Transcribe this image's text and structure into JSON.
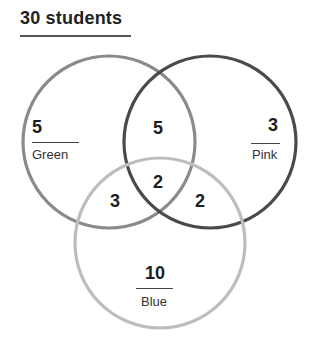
{
  "title": "30 students",
  "colors": {
    "green_circle": "#8a8a8a",
    "pink_circle": "#4a4a4a",
    "blue_circle": "#bdbdbd",
    "text": "#1e1e1e"
  },
  "sets": [
    {
      "name": "Green",
      "only_count": "5"
    },
    {
      "name": "Pink",
      "only_count": "3"
    },
    {
      "name": "Blue",
      "only_count": "10"
    }
  ],
  "regions": {
    "green_only": "5",
    "pink_only": "3",
    "blue_only": "10",
    "green_pink": "5",
    "green_blue": "3",
    "pink_blue": "2",
    "all_three": "2"
  },
  "labels": {
    "green": "Green",
    "pink": "Pink",
    "blue": "Blue"
  }
}
